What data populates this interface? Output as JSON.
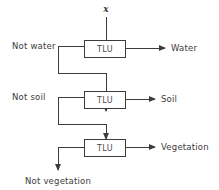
{
  "diagram": {
    "input_symbol": "x",
    "colors": {
      "line": "#3c3c3c",
      "text": "#3c3c3c",
      "box_fill": "#ffffff",
      "background": "#ffffff"
    },
    "units": [
      {
        "id": "tlu-1",
        "label": "TLU",
        "left_label": "Not water",
        "right_label": "Water"
      },
      {
        "id": "tlu-2",
        "label": "TLU",
        "left_label": "Not soil",
        "right_label": "Soil"
      },
      {
        "id": "tlu-3",
        "label": "TLU",
        "left_label": "",
        "right_label": "Vegetation"
      }
    ],
    "final_output_label": "Not vegetation"
  }
}
